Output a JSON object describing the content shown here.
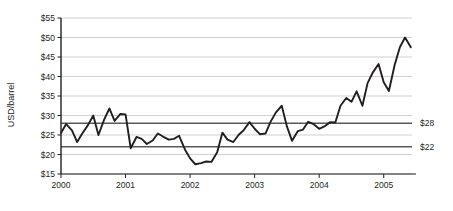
{
  "chart_data": {
    "type": "line",
    "title": "",
    "subtitle": "",
    "xlabel": "",
    "ylabel": "USD/barrel",
    "xlim": [
      2000.0,
      2005.5
    ],
    "ylim": [
      15,
      55
    ],
    "grid": true,
    "legend_position": "none",
    "y_ticks": [
      "$15",
      "$20",
      "$25",
      "$30",
      "$35",
      "$40",
      "$45",
      "$50",
      "$55"
    ],
    "y_tick_values": [
      15,
      20,
      25,
      30,
      35,
      40,
      45,
      50,
      55
    ],
    "x_ticks": [
      "2000",
      "2001",
      "2002",
      "2003",
      "2004",
      "2005"
    ],
    "x_tick_values": [
      2000,
      2001,
      2002,
      2003,
      2004,
      2005
    ],
    "series": [
      {
        "name": "Crude oil price",
        "color": "#231f20",
        "x": [
          2000.0,
          2000.08,
          2000.17,
          2000.25,
          2000.33,
          2000.42,
          2000.5,
          2000.58,
          2000.67,
          2000.75,
          2000.83,
          2000.92,
          2001.0,
          2001.08,
          2001.17,
          2001.25,
          2001.33,
          2001.42,
          2001.5,
          2001.58,
          2001.67,
          2001.75,
          2001.83,
          2001.92,
          2002.0,
          2002.08,
          2002.17,
          2002.25,
          2002.33,
          2002.42,
          2002.5,
          2002.58,
          2002.67,
          2002.75,
          2002.83,
          2002.92,
          2003.0,
          2003.08,
          2003.17,
          2003.25,
          2003.33,
          2003.42,
          2003.5,
          2003.58,
          2003.67,
          2003.75,
          2003.83,
          2003.92,
          2004.0,
          2004.08,
          2004.17,
          2004.25,
          2004.33,
          2004.42,
          2004.5,
          2004.58,
          2004.67,
          2004.75,
          2004.83,
          2004.92,
          2005.0,
          2005.08,
          2005.17,
          2005.25,
          2005.33,
          2005.42
        ],
        "values": [
          25.5,
          27.8,
          26.2,
          23.2,
          25.4,
          27.6,
          30.0,
          25.0,
          29.0,
          31.8,
          28.6,
          30.4,
          30.3,
          21.6,
          24.5,
          24.0,
          22.7,
          23.6,
          25.4,
          24.6,
          23.8,
          24.0,
          24.8,
          21.3,
          19.0,
          17.5,
          17.8,
          18.2,
          18.1,
          20.6,
          25.6,
          23.8,
          23.2,
          25.0,
          26.2,
          28.3,
          26.6,
          25.2,
          25.4,
          28.5,
          30.8,
          32.5,
          27.2,
          23.5,
          26.0,
          26.4,
          28.4,
          27.7,
          26.6,
          27.2,
          28.3,
          28.2,
          32.5,
          34.5,
          33.5,
          36.2,
          32.5,
          38.3,
          41.0,
          43.2,
          38.5,
          36.3,
          43.0,
          47.5,
          50.0,
          47.5
        ]
      }
    ],
    "reference_lines": [
      {
        "label": "$28",
        "value": 28,
        "color": "#58595b"
      },
      {
        "label": "$22",
        "value": 22,
        "color": "#58595b"
      }
    ],
    "annotations": []
  },
  "plot": {
    "axis_color": "#231f20",
    "grid_color": "#c9c9c9",
    "background": "#ffffff"
  }
}
